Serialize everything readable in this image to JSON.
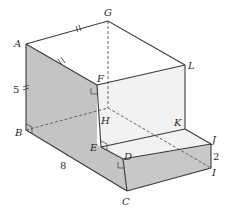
{
  "figure": {
    "colors": {
      "shaded_face": "#c4c4c4",
      "front_step_face": "#c8c8c8",
      "light_face": "#f2f2f2",
      "top_face": "#ffffff",
      "edge": "#3a3a3a"
    },
    "vertices": {
      "A": "A",
      "B": "B",
      "C": "C",
      "D": "D",
      "E": "E",
      "F": "F",
      "G": "G",
      "H": "H",
      "I": "I",
      "J": "J",
      "K": "K",
      "L": "L"
    },
    "measurements": {
      "AB": "5",
      "BC": "8",
      "IJ": "2"
    }
  }
}
